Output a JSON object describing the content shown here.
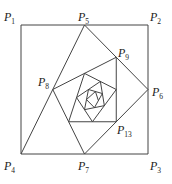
{
  "figure": {
    "type": "nested midpoint spiral",
    "line_color": "#444444",
    "background": "#ffffff",
    "square": {
      "P1": [
        21,
        25
      ],
      "P2": [
        148,
        25
      ],
      "P3": [
        148,
        154
      ],
      "P4": [
        21,
        154
      ]
    },
    "iterations": 20
  },
  "labels": [
    {
      "name": "P",
      "sub": "1",
      "x": 4,
      "y": 21
    },
    {
      "name": "P",
      "sub": "2",
      "x": 150,
      "y": 21
    },
    {
      "name": "P",
      "sub": "3",
      "x": 150,
      "y": 170
    },
    {
      "name": "P",
      "sub": "4",
      "x": 4,
      "y": 170
    },
    {
      "name": "P",
      "sub": "5",
      "x": 78,
      "y": 21
    },
    {
      "name": "P",
      "sub": "6",
      "x": 152,
      "y": 96
    },
    {
      "name": "P",
      "sub": "7",
      "x": 78,
      "y": 170
    },
    {
      "name": "P",
      "sub": "8",
      "x": 38,
      "y": 86
    },
    {
      "name": "P",
      "sub": "9",
      "x": 118,
      "y": 57
    },
    {
      "name": "P",
      "sub": "13",
      "x": 117,
      "y": 134
    }
  ]
}
